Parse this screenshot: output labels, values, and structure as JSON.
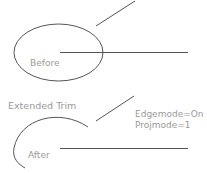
{
  "diagram": {
    "title": "Extended Trim",
    "before": {
      "label": "Before",
      "shapes": [
        "ellipse",
        "horizontal-line",
        "diagonal-line"
      ]
    },
    "after": {
      "label": "After",
      "settings": [
        "Edgemode=On",
        "Projmode=1"
      ],
      "shapes": [
        "trimmed-arc",
        "horizontal-line",
        "diagonal-line"
      ]
    },
    "colors": {
      "stroke": "#555555",
      "text": "#9a9a9a",
      "background": "#ffffff"
    }
  }
}
